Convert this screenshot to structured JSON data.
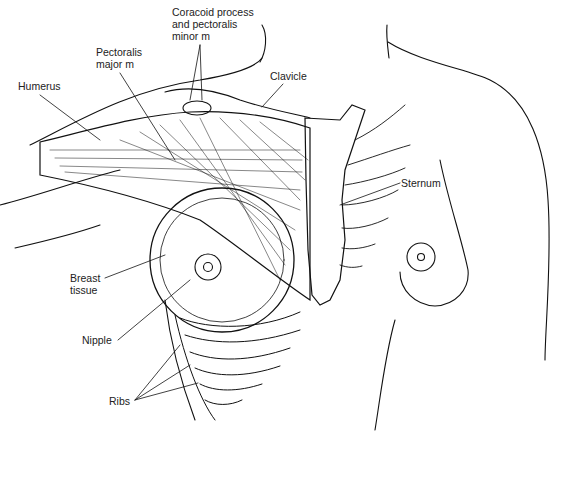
{
  "diagram": {
    "labels": {
      "coracoid": "Coracoid process\nand pectoralis\nminor m",
      "pectoralis_major": "Pectoralis\nmajor m",
      "humerus": "Humerus",
      "clavicle": "Clavicle",
      "sternum": "Sternum",
      "breast_tissue": "Breast\ntissue",
      "nipple": "Nipple",
      "ribs": "Ribs"
    },
    "colors": {
      "line": "#111111",
      "background": "#ffffff"
    }
  }
}
